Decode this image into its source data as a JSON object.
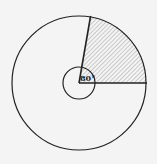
{
  "diagram": {
    "angle_label": "80°",
    "angle_degrees": 80,
    "colors": {
      "stroke": "#222222",
      "background": "#f4f4f4",
      "hatch": "#777777"
    }
  }
}
